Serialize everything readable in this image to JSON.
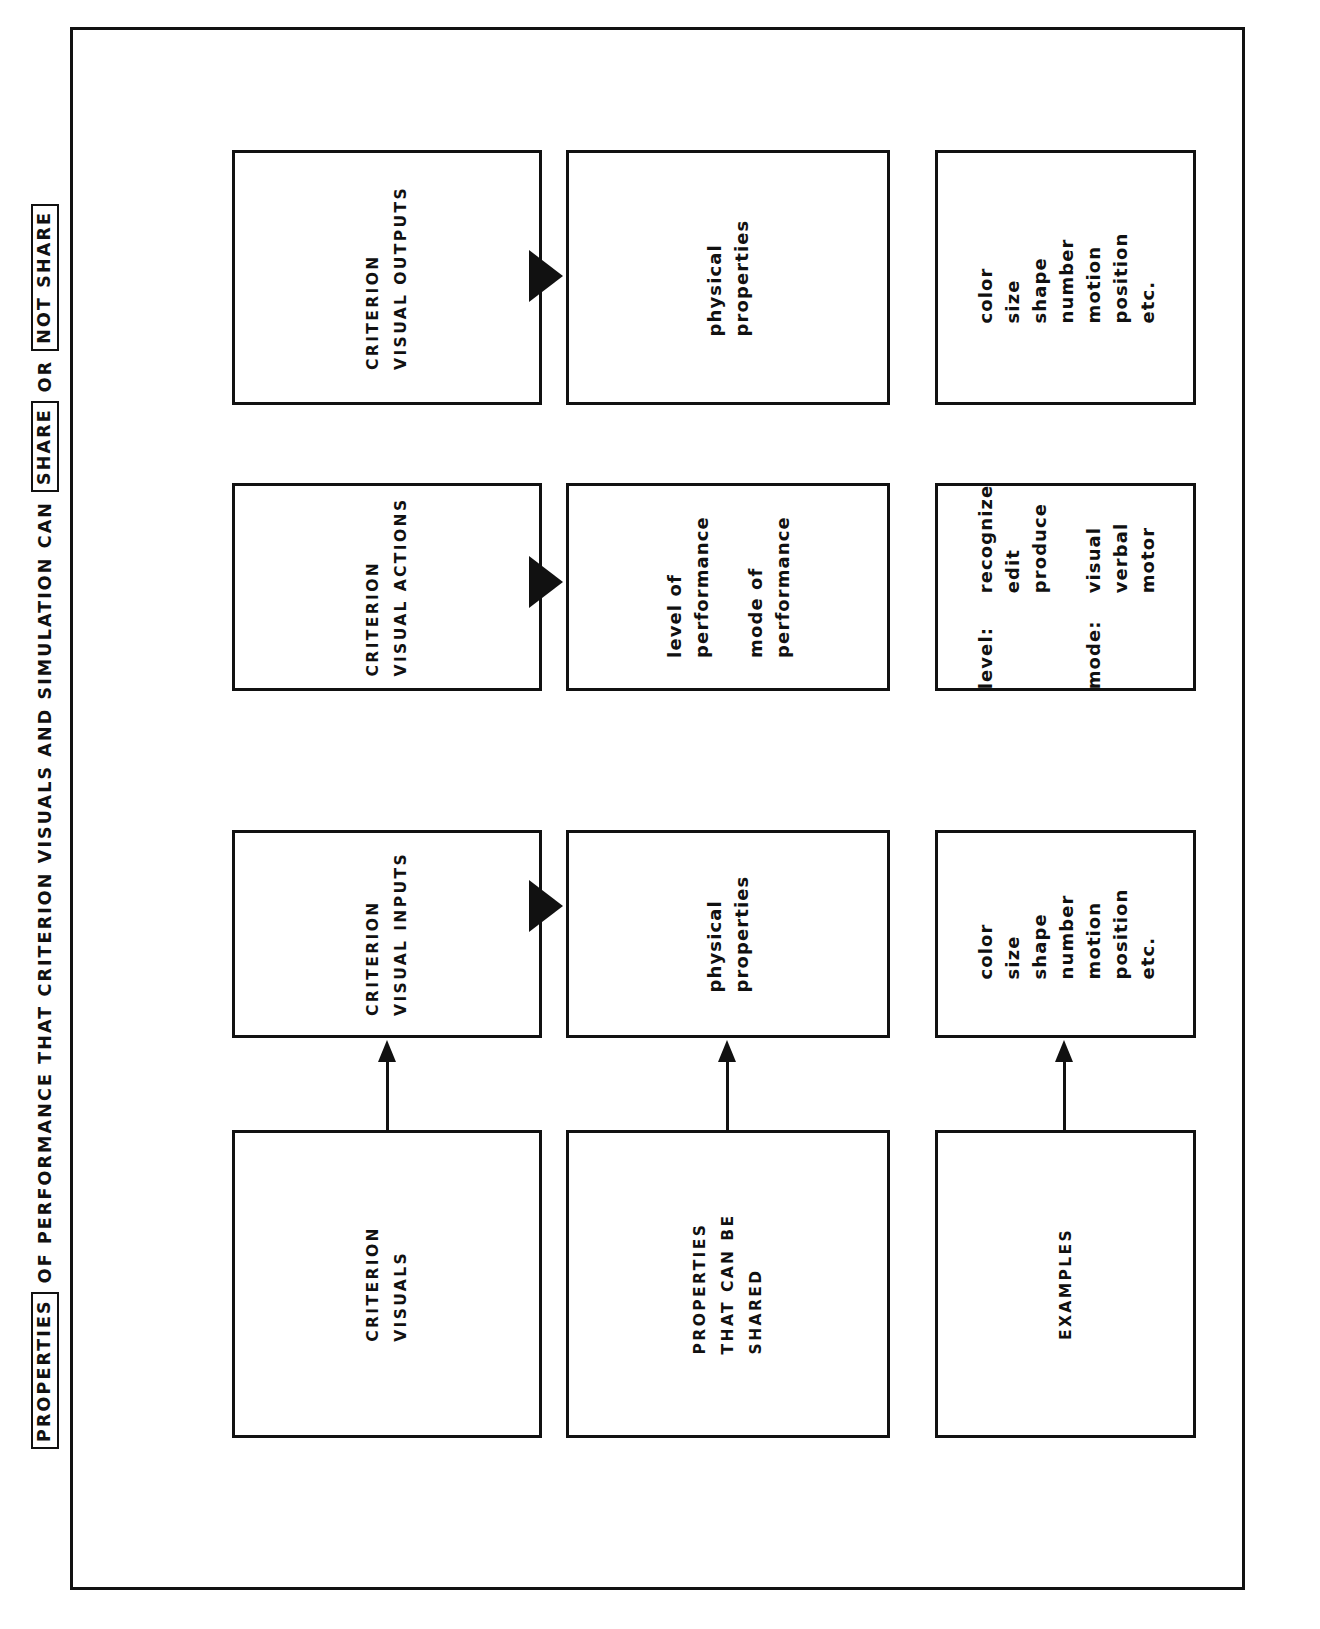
{
  "caption": {
    "segments": [
      {
        "text": "PROPERTIES",
        "boxed": true
      },
      {
        "text": "OF PERFORMANCE THAT CRITERION VISUALS AND SIMULATION CAN",
        "boxed": false
      },
      {
        "text": "SHARE",
        "boxed": true
      },
      {
        "text": "OR",
        "boxed": false
      },
      {
        "text": "NOT SHARE",
        "boxed": true
      }
    ]
  },
  "nodes": {
    "criterion_visuals": "CRITERION\nVISUALS",
    "properties_shared": "PROPERTIES\nTHAT CAN BE\nSHARED",
    "examples": "EXAMPLES",
    "criterion_visual_inputs": "CRITERION\nVISUAL INPUTS",
    "physical_properties_inputs": "physical\nproperties",
    "examples_inputs": "color\nsize\nshape\nnumber\nmotion\nposition\netc.",
    "criterion_visual_actions": "CRITERION\nVISUAL ACTIONS",
    "performance_actions": "level of\nperformance\n\nmode of\nperformance",
    "criterion_visual_outputs": "CRITERION\nVISUAL OUTPUTS",
    "physical_properties_outputs": "physical\nproperties",
    "examples_outputs": "color\nsize\nshape\nnumber\nmotion\nposition\netc."
  },
  "level_mode": {
    "level_label": "level:",
    "level_items": "recognize\nedit\nproduce",
    "mode_label": "mode:",
    "mode_items": "visual\nverbal\nmotor"
  },
  "colors": {
    "ink": "#111111",
    "paper": "#ffffff"
  }
}
